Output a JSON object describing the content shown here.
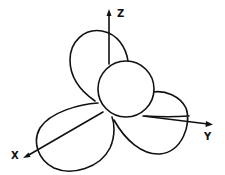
{
  "diagram": {
    "stroke_color": "#111111",
    "background": "#ffffff",
    "axes": {
      "z": {
        "label": "Z"
      },
      "x": {
        "label": "X"
      },
      "y": {
        "label": "Y"
      }
    }
  }
}
